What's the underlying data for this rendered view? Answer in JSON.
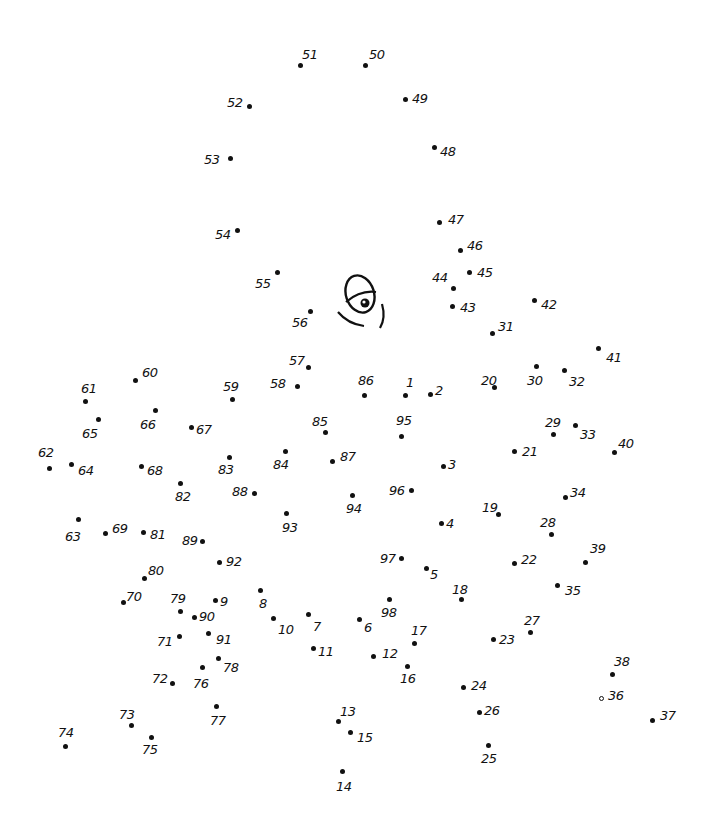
{
  "puzzle": {
    "type": "connect-the-dots",
    "total_points": 98,
    "ink_color": "#111111",
    "background": "#ffffff",
    "points": [
      {
        "n": "1",
        "x": 405,
        "y": 395,
        "lx": 406,
        "ly": 376
      },
      {
        "n": "2",
        "x": 430,
        "y": 394,
        "lx": 435,
        "ly": 384
      },
      {
        "n": "3",
        "x": 443,
        "y": 466,
        "lx": 448,
        "ly": 458
      },
      {
        "n": "4",
        "x": 441,
        "y": 523,
        "lx": 446,
        "ly": 517
      },
      {
        "n": "5",
        "x": 426,
        "y": 568,
        "lx": 430,
        "ly": 568
      },
      {
        "n": "6",
        "x": 359,
        "y": 619,
        "lx": 364,
        "ly": 621
      },
      {
        "n": "7",
        "x": 308,
        "y": 614,
        "lx": 313,
        "ly": 620
      },
      {
        "n": "8",
        "x": 260,
        "y": 590,
        "lx": 259,
        "ly": 597
      },
      {
        "n": "9",
        "x": 215,
        "y": 600,
        "lx": 220,
        "ly": 595
      },
      {
        "n": "10",
        "x": 273,
        "y": 618,
        "lx": 278,
        "ly": 623
      },
      {
        "n": "11",
        "x": 313,
        "y": 648,
        "lx": 318,
        "ly": 645
      },
      {
        "n": "12",
        "x": 373,
        "y": 656,
        "lx": 382,
        "ly": 647
      },
      {
        "n": "13",
        "x": 338,
        "y": 721,
        "lx": 340,
        "ly": 705
      },
      {
        "n": "14",
        "x": 342,
        "y": 771,
        "lx": 336,
        "ly": 780
      },
      {
        "n": "15",
        "x": 350,
        "y": 732,
        "lx": 357,
        "ly": 731
      },
      {
        "n": "16",
        "x": 407,
        "y": 666,
        "lx": 400,
        "ly": 672
      },
      {
        "n": "17",
        "x": 414,
        "y": 643,
        "lx": 411,
        "ly": 624
      },
      {
        "n": "18",
        "x": 461,
        "y": 599,
        "lx": 452,
        "ly": 583
      },
      {
        "n": "19",
        "x": 498,
        "y": 514,
        "lx": 482,
        "ly": 501
      },
      {
        "n": "20",
        "x": 494,
        "y": 387,
        "lx": 481,
        "ly": 374
      },
      {
        "n": "21",
        "x": 514,
        "y": 451,
        "lx": 522,
        "ly": 445
      },
      {
        "n": "22",
        "x": 514,
        "y": 563,
        "lx": 521,
        "ly": 553
      },
      {
        "n": "23",
        "x": 493,
        "y": 639,
        "lx": 499,
        "ly": 633
      },
      {
        "n": "24",
        "x": 463,
        "y": 687,
        "lx": 471,
        "ly": 679
      },
      {
        "n": "25",
        "x": 488,
        "y": 745,
        "lx": 481,
        "ly": 752
      },
      {
        "n": "26",
        "x": 479,
        "y": 712,
        "lx": 484,
        "ly": 704
      },
      {
        "n": "27",
        "x": 530,
        "y": 632,
        "lx": 524,
        "ly": 614
      },
      {
        "n": "28",
        "x": 551,
        "y": 534,
        "lx": 540,
        "ly": 516
      },
      {
        "n": "29",
        "x": 553,
        "y": 434,
        "lx": 545,
        "ly": 416
      },
      {
        "n": "30",
        "x": 536,
        "y": 366,
        "lx": 527,
        "ly": 374
      },
      {
        "n": "31",
        "x": 492,
        "y": 333,
        "lx": 498,
        "ly": 320
      },
      {
        "n": "32",
        "x": 564,
        "y": 370,
        "lx": 569,
        "ly": 375
      },
      {
        "n": "33",
        "x": 575,
        "y": 425,
        "lx": 580,
        "ly": 428
      },
      {
        "n": "34",
        "x": 565,
        "y": 497,
        "lx": 570,
        "ly": 486
      },
      {
        "n": "35",
        "x": 557,
        "y": 585,
        "lx": 565,
        "ly": 584
      },
      {
        "n": "36",
        "x": 601,
        "y": 698,
        "lx": 608,
        "ly": 689
      },
      {
        "n": "37",
        "x": 652,
        "y": 720,
        "lx": 660,
        "ly": 709
      },
      {
        "n": "38",
        "x": 612,
        "y": 674,
        "lx": 614,
        "ly": 655
      },
      {
        "n": "39",
        "x": 585,
        "y": 562,
        "lx": 590,
        "ly": 542
      },
      {
        "n": "40",
        "x": 614,
        "y": 452,
        "lx": 618,
        "ly": 437
      },
      {
        "n": "41",
        "x": 598,
        "y": 348,
        "lx": 606,
        "ly": 351
      },
      {
        "n": "42",
        "x": 534,
        "y": 300,
        "lx": 541,
        "ly": 298
      },
      {
        "n": "43",
        "x": 452,
        "y": 306,
        "lx": 460,
        "ly": 301
      },
      {
        "n": "44",
        "x": 453,
        "y": 288,
        "lx": 432,
        "ly": 271
      },
      {
        "n": "45",
        "x": 469,
        "y": 272,
        "lx": 477,
        "ly": 266
      },
      {
        "n": "46",
        "x": 460,
        "y": 250,
        "lx": 467,
        "ly": 239
      },
      {
        "n": "47",
        "x": 439,
        "y": 222,
        "lx": 448,
        "ly": 213
      },
      {
        "n": "48",
        "x": 434,
        "y": 147,
        "lx": 440,
        "ly": 145
      },
      {
        "n": "49",
        "x": 405,
        "y": 99,
        "lx": 412,
        "ly": 92
      },
      {
        "n": "50",
        "x": 365,
        "y": 65,
        "lx": 369,
        "ly": 48
      },
      {
        "n": "51",
        "x": 300,
        "y": 65,
        "lx": 302,
        "ly": 48
      },
      {
        "n": "52",
        "x": 249,
        "y": 106,
        "lx": 227,
        "ly": 96
      },
      {
        "n": "53",
        "x": 230,
        "y": 158,
        "lx": 204,
        "ly": 153
      },
      {
        "n": "54",
        "x": 237,
        "y": 230,
        "lx": 215,
        "ly": 228
      },
      {
        "n": "55",
        "x": 277,
        "y": 272,
        "lx": 255,
        "ly": 277
      },
      {
        "n": "56",
        "x": 310,
        "y": 311,
        "lx": 292,
        "ly": 316
      },
      {
        "n": "57",
        "x": 308,
        "y": 367,
        "lx": 289,
        "ly": 354
      },
      {
        "n": "58",
        "x": 297,
        "y": 386,
        "lx": 270,
        "ly": 377
      },
      {
        "n": "59",
        "x": 232,
        "y": 399,
        "lx": 223,
        "ly": 380
      },
      {
        "n": "60",
        "x": 135,
        "y": 380,
        "lx": 142,
        "ly": 366
      },
      {
        "n": "61",
        "x": 85,
        "y": 401,
        "lx": 81,
        "ly": 382
      },
      {
        "n": "62",
        "x": 49,
        "y": 468,
        "lx": 38,
        "ly": 446
      },
      {
        "n": "63",
        "x": 78,
        "y": 519,
        "lx": 65,
        "ly": 530
      },
      {
        "n": "64",
        "x": 71,
        "y": 464,
        "lx": 78,
        "ly": 464
      },
      {
        "n": "65",
        "x": 98,
        "y": 419,
        "lx": 82,
        "ly": 427
      },
      {
        "n": "66",
        "x": 155,
        "y": 410,
        "lx": 140,
        "ly": 418
      },
      {
        "n": "67",
        "x": 191,
        "y": 427,
        "lx": 196,
        "ly": 423
      },
      {
        "n": "68",
        "x": 141,
        "y": 466,
        "lx": 147,
        "ly": 464
      },
      {
        "n": "69",
        "x": 105,
        "y": 533,
        "lx": 112,
        "ly": 522
      },
      {
        "n": "70",
        "x": 123,
        "y": 602,
        "lx": 126,
        "ly": 590
      },
      {
        "n": "71",
        "x": 179,
        "y": 636,
        "lx": 157,
        "ly": 635
      },
      {
        "n": "72",
        "x": 172,
        "y": 683,
        "lx": 152,
        "ly": 672
      },
      {
        "n": "73",
        "x": 131,
        "y": 725,
        "lx": 119,
        "ly": 708
      },
      {
        "n": "74",
        "x": 65,
        "y": 746,
        "lx": 58,
        "ly": 726
      },
      {
        "n": "75",
        "x": 151,
        "y": 737,
        "lx": 142,
        "ly": 743
      },
      {
        "n": "76",
        "x": 202,
        "y": 667,
        "lx": 193,
        "ly": 677
      },
      {
        "n": "77",
        "x": 216,
        "y": 706,
        "lx": 210,
        "ly": 714
      },
      {
        "n": "78",
        "x": 218,
        "y": 658,
        "lx": 223,
        "ly": 661
      },
      {
        "n": "79",
        "x": 180,
        "y": 611,
        "lx": 170,
        "ly": 592
      },
      {
        "n": "80",
        "x": 144,
        "y": 578,
        "lx": 148,
        "ly": 564
      },
      {
        "n": "81",
        "x": 143,
        "y": 532,
        "lx": 150,
        "ly": 528
      },
      {
        "n": "82",
        "x": 180,
        "y": 483,
        "lx": 175,
        "ly": 490
      },
      {
        "n": "83",
        "x": 229,
        "y": 457,
        "lx": 218,
        "ly": 463
      },
      {
        "n": "84",
        "x": 285,
        "y": 451,
        "lx": 273,
        "ly": 458
      },
      {
        "n": "85",
        "x": 325,
        "y": 432,
        "lx": 312,
        "ly": 415
      },
      {
        "n": "86",
        "x": 364,
        "y": 395,
        "lx": 358,
        "ly": 374
      },
      {
        "n": "87",
        "x": 332,
        "y": 461,
        "lx": 340,
        "ly": 450
      },
      {
        "n": "88",
        "x": 254,
        "y": 493,
        "lx": 232,
        "ly": 485
      },
      {
        "n": "89",
        "x": 202,
        "y": 541,
        "lx": 182,
        "ly": 534
      },
      {
        "n": "90",
        "x": 194,
        "y": 617,
        "lx": 199,
        "ly": 610
      },
      {
        "n": "91",
        "x": 208,
        "y": 633,
        "lx": 216,
        "ly": 633
      },
      {
        "n": "92",
        "x": 219,
        "y": 562,
        "lx": 226,
        "ly": 555
      },
      {
        "n": "93",
        "x": 286,
        "y": 513,
        "lx": 282,
        "ly": 521
      },
      {
        "n": "94",
        "x": 352,
        "y": 495,
        "lx": 346,
        "ly": 502
      },
      {
        "n": "95",
        "x": 401,
        "y": 436,
        "lx": 396,
        "ly": 414
      },
      {
        "n": "96",
        "x": 411,
        "y": 490,
        "lx": 389,
        "ly": 484
      },
      {
        "n": "97",
        "x": 401,
        "y": 558,
        "lx": 380,
        "ly": 552
      },
      {
        "n": "98",
        "x": 389,
        "y": 599,
        "lx": 381,
        "ly": 606
      }
    ],
    "drawing": {
      "feature": "eye-icon",
      "position": {
        "x": 336,
        "y": 272
      }
    }
  }
}
